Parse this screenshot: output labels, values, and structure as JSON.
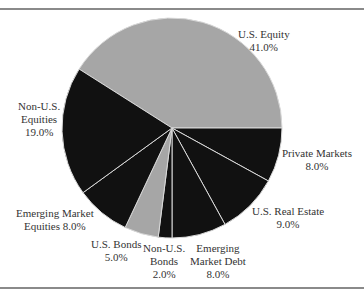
{
  "chart_data": {
    "type": "pie",
    "title": "",
    "start_angle_deg": 0,
    "slices": [
      {
        "label": "U.S. Equity",
        "value": 41.0,
        "value_label": "41.0%",
        "color": "#a6a6a6",
        "direction": "ccw"
      },
      {
        "label": "Private Markets",
        "value": 8.0,
        "value_label": "8.0%",
        "color": "#111111"
      },
      {
        "label": "U.S. Real Estate",
        "value": 9.0,
        "value_label": "9.0%",
        "color": "#111111"
      },
      {
        "label": "Emerging Market Debt",
        "value": 8.0,
        "value_label": "8.0%",
        "color": "#111111"
      },
      {
        "label": "Non-U.S. Bonds",
        "value": 2.0,
        "value_label": "2.0%",
        "color": "#111111"
      },
      {
        "label": "U.S. Bonds",
        "value": 5.0,
        "value_label": "5.0%",
        "color": "#a6a6a6"
      },
      {
        "label": "Emerging Market Equities",
        "value": 8.0,
        "value_label": "8.0%",
        "color": "#111111"
      },
      {
        "label": "Non-U.S. Equities",
        "value": 19.0,
        "value_label": "19.0%",
        "color": "#111111"
      }
    ],
    "legend": "none (direct labels)"
  },
  "labels": {
    "us_equity": {
      "line1": "U.S. Equity",
      "line2": "41.0%"
    },
    "non_us_equities": {
      "line1": "Non-U.S.",
      "line2": "Equities",
      "line3": "19.0%"
    },
    "private_markets": {
      "line1": "Private Markets",
      "line2": "8.0%"
    },
    "us_real_estate": {
      "line1": "U.S. Real Estate",
      "line2": "9.0%"
    },
    "em_equities": {
      "line1": "Emerging Market",
      "line2": "Equities 8.0%"
    },
    "us_bonds": {
      "line1": "U.S. Bonds",
      "line2": "5.0%"
    },
    "non_us_bonds": {
      "line1": "Non-U.S.",
      "line2": "Bonds",
      "line3": "2.0%"
    },
    "em_debt": {
      "line1": "Emerging",
      "line2": "Market Debt",
      "line3": "8.0%"
    }
  }
}
